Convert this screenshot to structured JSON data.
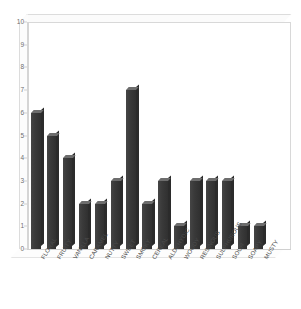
{
  "chart_data": {
    "type": "bar",
    "title": "",
    "subtitle": "",
    "xlabel": "",
    "ylabel": "",
    "ylim": [
      0,
      10
    ],
    "ytick_step": 1,
    "grid": false,
    "legend": "none",
    "style": "3d-column",
    "bar_color": "#3b3b3b",
    "axis_color": "#d5d5d5",
    "background": "#ffffff",
    "categories": [
      "FLORAL",
      "FRUITY",
      "VANILLA",
      "CARAMEL",
      "NUTTY",
      "SWEET",
      "SMOKY",
      "CEREAL",
      "ALDEHYDIC",
      "WOODY",
      "RESINOUS",
      "SULPHUROUS",
      "SOUR",
      "SOAPY",
      "MUSTY"
    ],
    "values": [
      6,
      5,
      4,
      2,
      2,
      3,
      7,
      2,
      3,
      1,
      3,
      3,
      3,
      1,
      1
    ],
    "yticks": [
      "0",
      "1",
      "2",
      "3",
      "4",
      "5",
      "6",
      "7",
      "8",
      "9",
      "10"
    ]
  }
}
